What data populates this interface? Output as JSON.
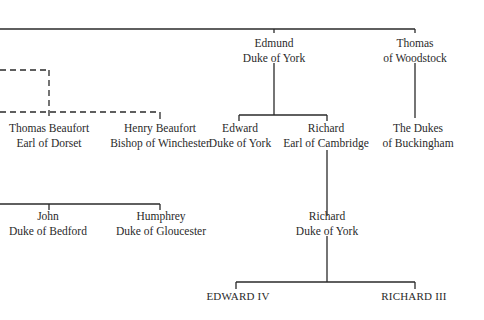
{
  "diagram": {
    "type": "family-tree",
    "nodes": {
      "edmund": {
        "line1": "Edmund",
        "line2": "Duke of York"
      },
      "thomas_woodstock": {
        "line1": "Thomas",
        "line2": "of Woodstock"
      },
      "thomas_beaufort": {
        "line1": "Thomas Beaufort",
        "line2": "Earl of Dorset"
      },
      "henry_beaufort": {
        "line1": "Henry Beaufort",
        "line2": "Bishop of Winchester"
      },
      "edward_york": {
        "line1": "Edward",
        "line2": "Duke of York"
      },
      "richard_cambridge": {
        "line1": "Richard",
        "line2": "Earl of Cambridge"
      },
      "dukes_buckingham": {
        "line1": "The Dukes",
        "line2": "of Buckingham"
      },
      "john_bedford": {
        "line1": "John",
        "line2": "Duke of Bedford"
      },
      "humphrey": {
        "line1": "Humphrey",
        "line2": "Duke of Gloucester"
      },
      "richard_york": {
        "line1": "Richard",
        "line2": "Duke of York"
      },
      "edward_iv": {
        "line1": "EDWARD IV"
      },
      "richard_iii": {
        "line1": "RICHARD III"
      }
    },
    "line_color": "#2a2a2a"
  }
}
